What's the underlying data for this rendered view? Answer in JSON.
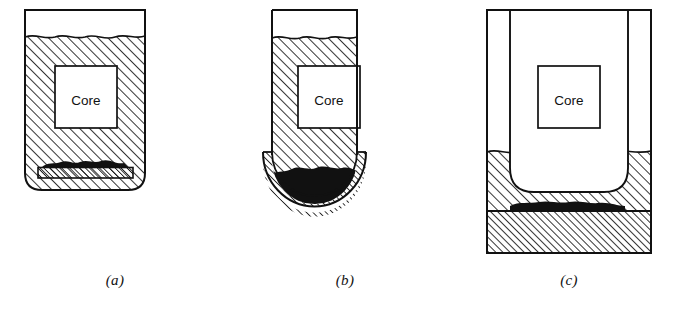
{
  "figure": {
    "background_color": "#ffffff",
    "line_color": "#111111",
    "hatch_color": "#111111",
    "debris_color": "#111111",
    "panels": [
      {
        "id": "a",
        "caption": "(a)",
        "core_label": "Core",
        "description": "flat-bottom vessel, water filled, debris bed on core support plate",
        "elements": {
          "vessel": "vessel-outline-flat-bottom",
          "water": "water-hatched-region",
          "water_surface": "wavy-free-surface-line",
          "core": "core-box",
          "support_plate": "hatched-core-support-plate",
          "debris": "dark-debris-bed"
        }
      },
      {
        "id": "b",
        "caption": "(b)",
        "core_label": "Core",
        "description": "vessel with hemispherical lower head, debris pooled in lower head",
        "elements": {
          "vessel": "vessel-outline-hemispherical-head",
          "water": "water-hatched-region",
          "water_surface": "wavy-free-surface-line",
          "core": "core-box",
          "lower_head": "hatched-lower-head-wall",
          "debris": "dark-debris-pool"
        }
      },
      {
        "id": "c",
        "caption": "(c)",
        "core_label": "Core",
        "description": "containment with inner vessel, water flooded cavity, debris spread on basemat",
        "elements": {
          "containment": "containment-outline",
          "inner_vessel": "inner-vessel-rounded-bottom",
          "water": "water-hatched-region",
          "water_surface": "wavy-free-surface-line",
          "core": "core-box",
          "basemat": "hatched-basemat",
          "debris": "dark-debris-spread"
        }
      }
    ]
  }
}
